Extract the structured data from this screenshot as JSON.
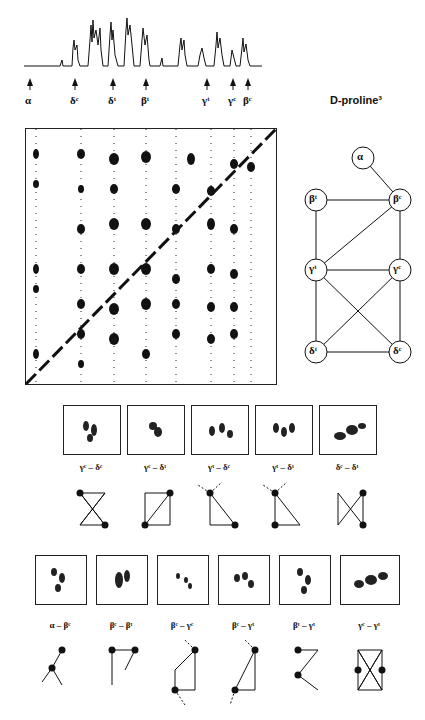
{
  "spectrum": {
    "labels": [
      {
        "text": "α",
        "x": 30
      },
      {
        "text": "δᶜ",
        "x": 75
      },
      {
        "text": "δᵗ",
        "x": 113
      },
      {
        "text": "βᵗ",
        "x": 146
      },
      {
        "text": "γᵗ",
        "x": 207
      },
      {
        "text": "γᶜ",
        "x": 233
      },
      {
        "text": "βᶜ",
        "x": 248
      }
    ]
  },
  "title": "D-proline³",
  "graph": {
    "nodes": [
      {
        "id": "alpha",
        "label": "α",
        "x": 363,
        "y": 158
      },
      {
        "id": "beta_t",
        "label": "βᵗ",
        "x": 316,
        "y": 200
      },
      {
        "id": "beta_c",
        "label": "βᶜ",
        "x": 400,
        "y": 200
      },
      {
        "id": "gamma_t",
        "label": "γᵗ",
        "x": 316,
        "y": 270
      },
      {
        "id": "gamma_c",
        "label": "γᶜ",
        "x": 400,
        "y": 270
      },
      {
        "id": "delta_t",
        "label": "δᵗ",
        "x": 316,
        "y": 352
      },
      {
        "id": "delta_c",
        "label": "δᶜ",
        "x": 400,
        "y": 352
      }
    ]
  },
  "row1": {
    "panels": [
      {
        "label": "γᶜ – δᶜ"
      },
      {
        "label": "γᶜ – δᵗ"
      },
      {
        "label": "γᵗ – δᶜ"
      },
      {
        "label": "γᵗ – δᵗ"
      },
      {
        "label": "δᶜ – δᵗ"
      }
    ]
  },
  "row2": {
    "panels": [
      {
        "label": "α – βᶜ"
      },
      {
        "label": "βᶜ – βᵗ"
      },
      {
        "label": "βᶜ – γᶜ"
      },
      {
        "label": "βᶜ – γᵗ"
      },
      {
        "label": "βᵗ – γᵗ"
      },
      {
        "label": "γᶜ – γᵗ"
      }
    ]
  }
}
